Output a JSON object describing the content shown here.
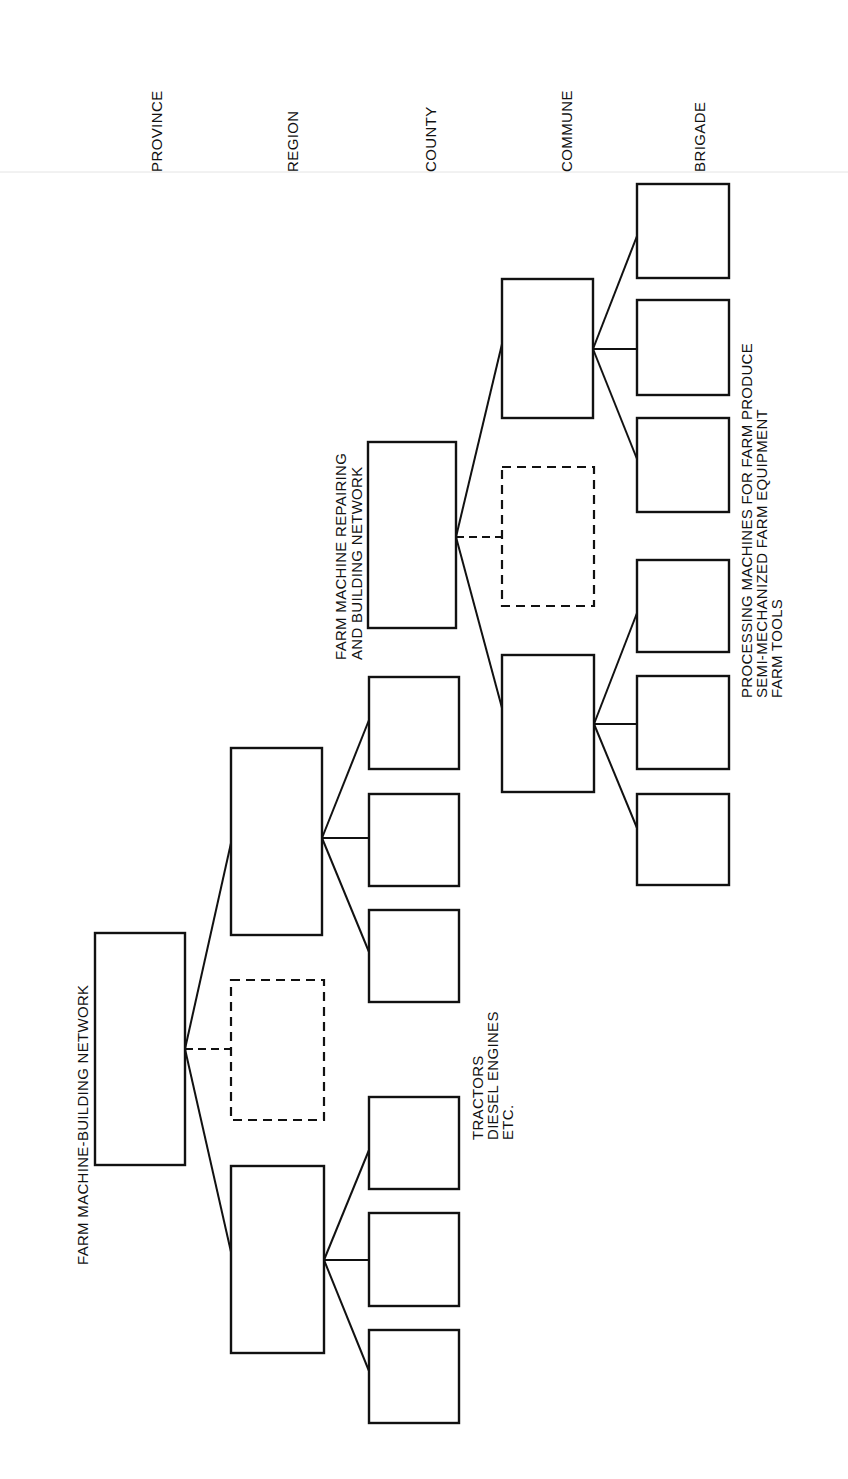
{
  "levels": [
    {
      "label": "PROVINCE"
    },
    {
      "label": "REGION"
    },
    {
      "label": "COUNTY"
    },
    {
      "label": "COMMUNE"
    },
    {
      "label": "BRIGADE"
    }
  ],
  "networks": {
    "provincial": {
      "label": "FARM MACHINE-BUILDING NETWORK"
    },
    "county": {
      "lines": [
        "FARM MACHINE REPAIRING",
        "AND BUILDING NETWORK"
      ]
    }
  },
  "annotations": {
    "county_products": [
      "TRACTORS",
      "DIESEL ENGINES",
      "ETC."
    ],
    "brigade_products": [
      "PROCESSING MACHINES FOR FARM PRODUCE",
      "SEMI-MECHANIZED FARM EQUIPMENT",
      "FARM TOOLS"
    ]
  },
  "tree": {
    "province": {
      "boxes": 1
    },
    "region": {
      "boxes": 2,
      "dashed_boxes": 1
    },
    "county": {
      "boxes_per_region": 3
    },
    "commune": {
      "boxes": 2,
      "dashed_boxes": 1
    },
    "brigade": {
      "boxes_per_commune": 3
    }
  }
}
